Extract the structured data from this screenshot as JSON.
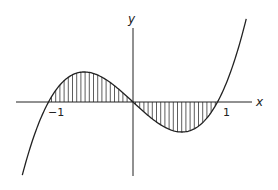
{
  "figure": {
    "function": "y = x^3 - x",
    "x_axis_label": "x",
    "y_axis_label": "y",
    "tick_labels": [
      {
        "value": -1,
        "text": "−1"
      },
      {
        "value": 1,
        "text": "1"
      }
    ],
    "shaded_regions": [
      {
        "from": -1,
        "to": 0,
        "side": "above x-axis"
      },
      {
        "from": 0,
        "to": 1,
        "side": "below x-axis"
      }
    ],
    "shading_style": "vertical hatching",
    "colors": {
      "line": "#222222",
      "hatch": "#333333",
      "background": "#ffffff"
    }
  },
  "chart_data": {
    "type": "line",
    "title": "",
    "xlabel": "x",
    "ylabel": "y",
    "x_range": [
      -1.31,
      1.34
    ],
    "x_ticks": [
      -1,
      1
    ],
    "series": [
      {
        "name": "y = x^3 - x",
        "x": [
          -1.3,
          -1.0,
          -0.577,
          0,
          0.577,
          1.0,
          1.3
        ],
        "y": [
          -0.897,
          0,
          0.385,
          0,
          -0.385,
          0,
          0.897
        ]
      }
    ],
    "grid": false,
    "legend": "none"
  }
}
